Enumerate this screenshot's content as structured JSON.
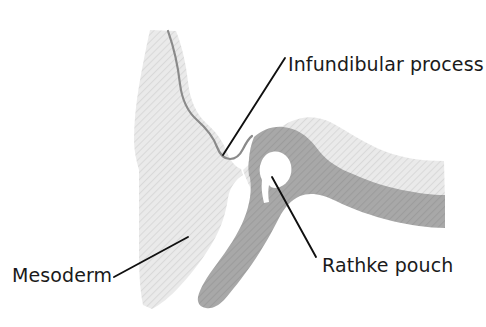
{
  "figure": {
    "kind": "anatomical-illustration",
    "background_color": "#ffffff"
  },
  "palette": {
    "mesoderm_fill": "#e6e6e6",
    "mesoderm_hatch": "#d4d4d4",
    "ectoderm_fill": "#a3a3a3",
    "ectoderm_hatch": "#9a9a9a",
    "neural_outline": "#8a8a8a",
    "lumen_fill": "#ffffff",
    "leader_line": "#101010",
    "label_text": "#1a1a1a"
  },
  "labels": [
    {
      "id": "infundibular-process",
      "text": "Infundibular process",
      "text_x": 288,
      "text_y": 71,
      "anchor": "start",
      "leader": {
        "x1": 285,
        "y1": 58,
        "x2": 223,
        "y2": 155
      }
    },
    {
      "id": "rathke-pouch",
      "text": "Rathke pouch",
      "text_x": 322,
      "text_y": 272,
      "anchor": "start",
      "leader": {
        "x1": 272,
        "y1": 177,
        "x2": 316,
        "y2": 257
      }
    },
    {
      "id": "mesoderm",
      "text": "Mesoderm",
      "text_x": 12,
      "text_y": 282,
      "anchor": "start",
      "leader": {
        "x1": 114,
        "y1": 277,
        "x2": 188,
        "y2": 237
      }
    }
  ],
  "regions": [
    {
      "id": "mesoderm-mass",
      "name": "Mesoderm",
      "fill": "#e6e6e6",
      "description": "Large pale hatched mass occupying the left and upper-right of the figure"
    },
    {
      "id": "neural-ectoderm",
      "name": "Neural ectoderm / infundibular process",
      "fill": "#e6e6e6",
      "outline": "#8a8a8a",
      "description": "Pale lobe with a grey outline descending from the upper left to a rounded tip"
    },
    {
      "id": "oral-ectoderm",
      "name": "Oral ectoderm / Rathke pouch",
      "fill": "#a3a3a3",
      "description": "Medium grey band that folds upward into a hook enclosing a white lumen"
    },
    {
      "id": "rathke-lumen",
      "name": "Rathke pouch lumen",
      "fill": "#ffffff",
      "description": "White teardrop cavity inside the grey hook"
    }
  ]
}
